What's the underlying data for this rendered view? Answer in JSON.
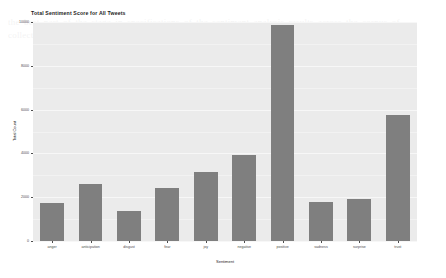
{
  "chart_data": {
    "type": "bar",
    "title": "Total Sentiment Score for All Tweets",
    "xlabel": "Sentiment",
    "ylabel": "Total Count",
    "categories": [
      "anger",
      "anticipation",
      "disgust",
      "fear",
      "joy",
      "negative",
      "positive",
      "sadness",
      "surprise",
      "trust"
    ],
    "values": [
      1750,
      2600,
      1350,
      2400,
      3150,
      3950,
      9850,
      1800,
      1900,
      5750
    ],
    "ylim": [
      0,
      10000
    ],
    "yticks": [
      0,
      2000,
      4000,
      6000,
      8000,
      10000
    ],
    "ytick_labels": [
      "0",
      "2000",
      "4000",
      "6000",
      "8000",
      "10000"
    ],
    "grid": true,
    "legend": "none",
    "bar_color": "#7f7f7f",
    "panel_color": "#ebebeb",
    "grid_color": "#f7f7f7"
  },
  "background_text": "the best part of the stage in specifications of the sentiment analysis results across the corpus of collected tweets is shown below where we can observe that the positive sentiment dominates"
}
